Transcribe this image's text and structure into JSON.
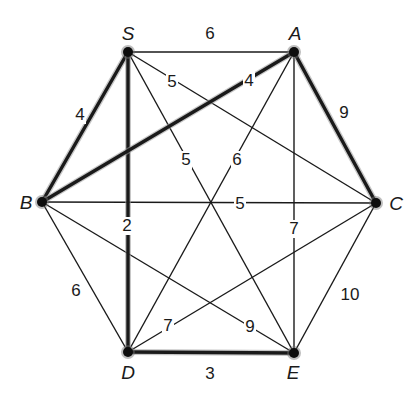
{
  "diagram": {
    "type": "weighted-undirected-graph",
    "nodes": [
      {
        "id": "S",
        "label": "S",
        "x": 128,
        "y": 52,
        "lx": 128,
        "ly": 40
      },
      {
        "id": "A",
        "label": "A",
        "x": 294,
        "y": 52,
        "lx": 295,
        "ly": 40
      },
      {
        "id": "C",
        "label": "C",
        "x": 376,
        "y": 203,
        "lx": 396,
        "ly": 210
      },
      {
        "id": "B",
        "label": "B",
        "x": 42,
        "y": 202,
        "lx": 26,
        "ly": 209
      },
      {
        "id": "D",
        "label": "D",
        "x": 128,
        "y": 352,
        "lx": 128,
        "ly": 379
      },
      {
        "id": "E",
        "label": "E",
        "x": 294,
        "y": 353,
        "lx": 293,
        "ly": 379
      }
    ],
    "edges": [
      {
        "from": "S",
        "to": "A",
        "weight": "6",
        "highlighted": false,
        "wx": 210,
        "wy": 39
      },
      {
        "from": "S",
        "to": "B",
        "weight": "4",
        "highlighted": true,
        "wx": 80,
        "wy": 120
      },
      {
        "from": "S",
        "to": "C",
        "weight": "5",
        "highlighted": false,
        "wx": 172,
        "wy": 87
      },
      {
        "from": "S",
        "to": "E",
        "weight": "5",
        "highlighted": false,
        "wx": 186,
        "wy": 165
      },
      {
        "from": "S",
        "to": "D",
        "weight": "2",
        "highlighted": true,
        "wx": 127,
        "wy": 231
      },
      {
        "from": "A",
        "to": "B",
        "weight": "4",
        "highlighted": true,
        "wx": 249,
        "wy": 86
      },
      {
        "from": "A",
        "to": "C",
        "weight": "9",
        "highlighted": true,
        "wx": 344,
        "wy": 118
      },
      {
        "from": "A",
        "to": "D",
        "weight": "6",
        "highlighted": false,
        "wx": 237,
        "wy": 165
      },
      {
        "from": "A",
        "to": "E",
        "weight": "7",
        "highlighted": false,
        "wx": 294,
        "wy": 234
      },
      {
        "from": "B",
        "to": "C",
        "weight": "5",
        "highlighted": false,
        "wx": 240,
        "wy": 209
      },
      {
        "from": "B",
        "to": "D",
        "weight": "6",
        "highlighted": false,
        "wx": 76,
        "wy": 296
      },
      {
        "from": "B",
        "to": "E",
        "weight": "9",
        "highlighted": false,
        "wx": 250,
        "wy": 332
      },
      {
        "from": "C",
        "to": "D",
        "weight": "7",
        "highlighted": false,
        "wx": 168,
        "wy": 331
      },
      {
        "from": "C",
        "to": "E",
        "weight": "10",
        "highlighted": false,
        "wx": 350,
        "wy": 300
      },
      {
        "from": "D",
        "to": "E",
        "weight": "3",
        "highlighted": true,
        "wx": 210,
        "wy": 379
      }
    ]
  }
}
